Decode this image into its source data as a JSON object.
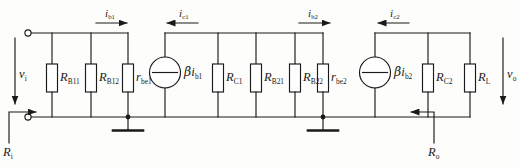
{
  "diagram": {
    "type": "schematic",
    "line_color": "#1a1a1a",
    "background": "#fdfdfb"
  },
  "terminals": {
    "input_top": "o",
    "input_bottom": "o"
  },
  "sources": {
    "stage1": {
      "symbol": "current-source",
      "label_beta": "β",
      "label_i": "i",
      "label_sub": "b1"
    },
    "stage2": {
      "symbol": "current-source",
      "label_beta": "β",
      "label_i": "i",
      "label_sub": "b2"
    }
  },
  "components": [
    {
      "name": "R_B11",
      "base": "R",
      "sub": "B11",
      "type": "resistor"
    },
    {
      "name": "R_B12",
      "base": "R",
      "sub": "B12",
      "type": "resistor"
    },
    {
      "name": "r_be1",
      "base": "r",
      "sub": "be1",
      "type": "resistor"
    },
    {
      "name": "R_C1",
      "base": "R",
      "sub": "C1",
      "type": "resistor"
    },
    {
      "name": "R_B21",
      "base": "R",
      "sub": "B21",
      "type": "resistor"
    },
    {
      "name": "R_B22",
      "base": "R",
      "sub": "B22",
      "type": "resistor"
    },
    {
      "name": "r_be2",
      "base": "r",
      "sub": "be2",
      "type": "resistor"
    },
    {
      "name": "R_C2",
      "base": "R",
      "sub": "C2",
      "type": "resistor"
    },
    {
      "name": "R_L",
      "base": "R",
      "sub": "L",
      "type": "resistor"
    }
  ],
  "currents": [
    {
      "name": "i_b1",
      "base": "i",
      "sub": "b1",
      "direction": "right"
    },
    {
      "name": "i_c1",
      "base": "i",
      "sub": "c1",
      "direction": "left"
    },
    {
      "name": "i_b2",
      "base": "i",
      "sub": "b2",
      "direction": "right"
    },
    {
      "name": "i_c2",
      "base": "i",
      "sub": "c2",
      "direction": "left"
    }
  ],
  "voltages": [
    {
      "name": "v_i",
      "base": "v",
      "sub": "i",
      "direction": "down"
    },
    {
      "name": "v_o",
      "base": "v",
      "sub": "o",
      "direction": "down"
    }
  ],
  "impedances": [
    {
      "name": "R_i",
      "base": "R",
      "sub": "i",
      "direction": "right"
    },
    {
      "name": "R_o",
      "base": "R",
      "sub": "o",
      "direction": "left"
    }
  ],
  "ground_symbols": 2
}
